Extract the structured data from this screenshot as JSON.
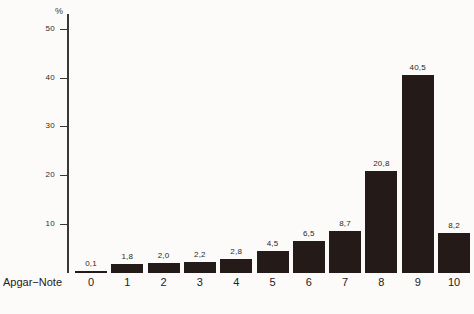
{
  "chart_data": {
    "type": "bar",
    "title": "",
    "subtitle": "",
    "xlabel": "Apgar−Note",
    "ylabel": "%",
    "categories": [
      "0",
      "1",
      "2",
      "3",
      "4",
      "5",
      "6",
      "7",
      "8",
      "9",
      "10"
    ],
    "values": [
      0.1,
      1.8,
      2.0,
      2.2,
      2.8,
      4.5,
      6.5,
      8.7,
      20.8,
      40.5,
      8.2
    ],
    "value_labels": [
      "0,1",
      "1,8",
      "2,0",
      "2,2",
      "2,8",
      "4,5",
      "6,5",
      "8,7",
      "20,8",
      "40,5",
      "8,2"
    ],
    "ylim": [
      0,
      53
    ],
    "y_ticks": [
      10,
      20,
      30,
      40,
      50
    ],
    "y_tick_labels": [
      "10",
      "20",
      "30",
      "40",
      "50"
    ],
    "grid": false,
    "legend": null,
    "bar_color": "#241a18",
    "axis_color": "#3a3734",
    "background_color": "#fcfbf9",
    "decimal_separator": ","
  }
}
